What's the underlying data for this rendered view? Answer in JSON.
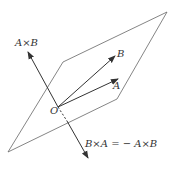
{
  "diagram": {
    "labels": {
      "axb": "A×B",
      "b": "B",
      "a": "A",
      "origin": "O",
      "bxa": "B×A = − A×B"
    },
    "colors": {
      "line": "#555555",
      "arrow": "#333333"
    }
  }
}
